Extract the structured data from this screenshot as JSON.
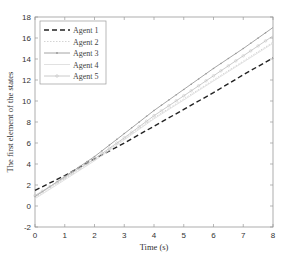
{
  "chart_data": {
    "type": "line",
    "title": "",
    "xlabel": "Time (s)",
    "ylabel": "The first element of the states",
    "xlim": [
      0,
      8
    ],
    "ylim": [
      -2,
      18
    ],
    "xticks": [
      0,
      1,
      2,
      3,
      4,
      5,
      6,
      7,
      8
    ],
    "yticks": [
      -2,
      0,
      2,
      4,
      6,
      8,
      10,
      12,
      14,
      16,
      18
    ],
    "grid": false,
    "legend_position": "upper left",
    "x": [
      0,
      1,
      2,
      3,
      4,
      5,
      6,
      7,
      8
    ],
    "series": [
      {
        "name": "Agent 1",
        "style": "dashed",
        "color": "#222222",
        "marker": "none",
        "values": [
          1.5,
          2.9,
          4.5,
          6.0,
          7.6,
          9.2,
          10.8,
          12.5,
          14.1
        ]
      },
      {
        "name": "Agent 2",
        "style": "dotted",
        "color": "#cfcfcf",
        "marker": "none",
        "values": [
          0.8,
          2.6,
          4.4,
          6.4,
          8.4,
          10.2,
          12.0,
          13.8,
          15.6
        ]
      },
      {
        "name": "Agent 3",
        "style": "solid",
        "color": "#9a9a9a",
        "marker": "*",
        "values": [
          0.9,
          2.8,
          4.7,
          6.9,
          9.1,
          11.1,
          13.1,
          15.0,
          17.0
        ]
      },
      {
        "name": "Agent 4",
        "style": "solid",
        "color": "#dedede",
        "marker": "none",
        "values": [
          0.7,
          2.5,
          4.3,
          6.3,
          8.3,
          10.1,
          11.9,
          13.7,
          15.5
        ]
      },
      {
        "name": "Agent 5",
        "style": "solid",
        "color": "#c4c4c4",
        "marker": "o",
        "values": [
          1.0,
          2.7,
          4.5,
          6.5,
          8.6,
          10.5,
          12.4,
          14.3,
          16.2
        ]
      }
    ]
  }
}
